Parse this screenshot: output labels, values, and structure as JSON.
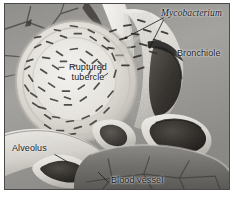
{
  "figure": {
    "style": "grayscale airbrush medical illustration",
    "frame_color": "#4a4a4a",
    "background_color": "#9a9a9a"
  },
  "labels": {
    "mycobacterium": "Mycobacterium",
    "bronchiole": "Bronchiole",
    "ruptured_tubercle_line1": "Ruptured",
    "ruptured_tubercle_line2": "tubercle",
    "alveolus": "Alveolus",
    "blood_vessel": "Blood vessel"
  },
  "palette": {
    "tissue_light": "#e8e6e1",
    "tissue_mid": "#b9b7b2",
    "tissue_dark": "#6d6b68",
    "lumen_dark": "#2a2724",
    "bacillus": "#3a3834",
    "label_text": "#1b1b1b"
  },
  "structures": [
    {
      "name": "ruptured-tubercle",
      "description": "large pale caseous nodule filled with rod-shaped bacilli"
    },
    {
      "name": "bronchiole",
      "description": "airway with dark lumen and stippled granular wall"
    },
    {
      "name": "alveolus",
      "description": "thin-walled air sac at lower left"
    },
    {
      "name": "blood-vessel",
      "description": "dark kidney-shaped vessel lumens in pale walls"
    },
    {
      "name": "alveolar-septa",
      "description": "polygonal web of dark septal lines over gray tissue"
    },
    {
      "name": "mycobacteria",
      "description": "scattered dark bacilli escaping the ruptured tubercle"
    }
  ]
}
